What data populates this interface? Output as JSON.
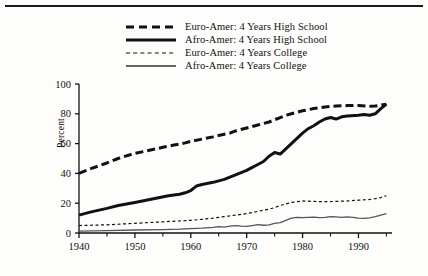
{
  "figure": {
    "name": "educational-attainment-line-chart",
    "background_color": "#fdfdfc",
    "ink_color": "#111111"
  },
  "chart_data": {
    "type": "line",
    "title": "",
    "subtitle": "",
    "xlabel": "",
    "ylabel": "Percent",
    "xlim": [
      1940,
      1996
    ],
    "ylim": [
      0,
      100
    ],
    "grid": false,
    "legend_position": "top-center",
    "x_ticks_major": [
      1940,
      1950,
      1960,
      1970,
      1980,
      1990
    ],
    "x_ticks_minor": [
      1945,
      1955,
      1965,
      1975,
      1985,
      1995
    ],
    "x_tick_labels": [
      "1940",
      "1950",
      "1960",
      "1970",
      "1980",
      "1990"
    ],
    "y_ticks": [
      0,
      20,
      40,
      60,
      80,
      100
    ],
    "y_tick_labels": [
      "0",
      "20",
      "40",
      "60",
      "80",
      "100"
    ],
    "series": [
      {
        "name": "Euro-Amer: 4 Years High School",
        "style": "thick-dashed",
        "color": "#111111",
        "width": 3.0,
        "dash": "8,4",
        "x": [
          1940,
          1942,
          1945,
          1947,
          1950,
          1952,
          1955,
          1957,
          1959,
          1960,
          1962,
          1964,
          1965,
          1967,
          1968,
          1970,
          1972,
          1974,
          1975,
          1976,
          1977,
          1978,
          1980,
          1982,
          1984,
          1985,
          1986,
          1988,
          1990,
          1992,
          1993,
          1994,
          1995
        ],
        "y": [
          40.0,
          43.0,
          47.0,
          50.0,
          53.5,
          55.0,
          57.5,
          59.0,
          60.5,
          61.5,
          63.0,
          64.5,
          65.5,
          67.0,
          68.5,
          70.5,
          72.5,
          74.5,
          76.0,
          77.5,
          79.0,
          80.0,
          82.0,
          83.5,
          84.5,
          85.0,
          85.2,
          85.5,
          85.5,
          85.0,
          85.2,
          85.8,
          86.5
        ],
        "endpoint_value": 86.5
      },
      {
        "name": "Afro-Amer: 4 Years High School",
        "style": "thick-solid",
        "color": "#111111",
        "width": 3.0,
        "dash": "",
        "x": [
          1940,
          1942,
          1945,
          1947,
          1950,
          1952,
          1954,
          1956,
          1958,
          1959,
          1960,
          1961,
          1962,
          1964,
          1966,
          1967,
          1968,
          1969,
          1970,
          1971,
          1972,
          1973,
          1974,
          1975,
          1976,
          1977,
          1978,
          1979,
          1980,
          1981,
          1982,
          1983,
          1984,
          1985,
          1986,
          1987,
          1988,
          1990,
          1991,
          1992,
          1993,
          1994,
          1995
        ],
        "y": [
          12.0,
          14.0,
          16.5,
          18.5,
          20.5,
          22.0,
          23.5,
          25.0,
          26.0,
          27.0,
          28.5,
          31.5,
          32.5,
          34.0,
          36.0,
          37.5,
          39.0,
          40.5,
          42.0,
          44.0,
          46.0,
          48.0,
          51.5,
          54.0,
          53.0,
          56.5,
          60.0,
          63.5,
          67.0,
          70.0,
          72.0,
          74.5,
          76.5,
          77.5,
          76.5,
          78.0,
          78.5,
          79.0,
          79.5,
          79.0,
          80.0,
          83.5,
          86.5
        ],
        "endpoint_value": 86.5
      },
      {
        "name": "Euro-Amer: 4 Years College",
        "style": "thin-dotted",
        "color": "#111111",
        "width": 1.2,
        "dash": "3,2.5",
        "x": [
          1940,
          1945,
          1950,
          1955,
          1960,
          1962,
          1964,
          1966,
          1968,
          1970,
          1972,
          1974,
          1975,
          1976,
          1977,
          1978,
          1979,
          1980,
          1982,
          1984,
          1986,
          1988,
          1990,
          1992,
          1993,
          1994,
          1995
        ],
        "y": [
          5.0,
          5.5,
          6.5,
          7.5,
          8.5,
          9.2,
          10.0,
          11.0,
          12.0,
          13.0,
          14.5,
          16.0,
          17.0,
          18.5,
          19.5,
          20.5,
          21.0,
          21.5,
          21.2,
          21.0,
          21.2,
          21.5,
          22.0,
          22.5,
          23.0,
          23.8,
          25.0
        ],
        "endpoint_value": 25.0
      },
      {
        "name": "Afro-Amer: 4 Years College",
        "style": "thin-solid",
        "color": "#555555",
        "width": 1.3,
        "dash": "",
        "x": [
          1940,
          1945,
          1950,
          1955,
          1958,
          1960,
          1962,
          1964,
          1965,
          1966,
          1967,
          1968,
          1969,
          1970,
          1971,
          1972,
          1973,
          1974,
          1975,
          1976,
          1977,
          1978,
          1979,
          1980,
          1981,
          1982,
          1983,
          1984,
          1985,
          1986,
          1987,
          1988,
          1989,
          1990,
          1991,
          1992,
          1993,
          1994,
          1995
        ],
        "y": [
          1.3,
          1.6,
          2.0,
          2.3,
          2.6,
          3.0,
          3.3,
          3.8,
          4.3,
          4.0,
          4.6,
          5.0,
          4.6,
          4.4,
          5.0,
          5.6,
          5.2,
          5.5,
          6.5,
          7.0,
          8.5,
          10.0,
          10.5,
          10.3,
          10.5,
          10.6,
          10.3,
          10.5,
          11.0,
          10.8,
          10.5,
          10.8,
          10.5,
          10.0,
          9.8,
          10.2,
          11.0,
          12.0,
          13.0
        ],
        "endpoint_value": 13.0
      }
    ]
  },
  "legend": {
    "items": [
      {
        "label": "Euro-Amer: 4 Years High School",
        "sample": "thick-dashed"
      },
      {
        "label": "Afro-Amer: 4 Years High School",
        "sample": "thick-solid"
      },
      {
        "label": "Euro-Amer: 4 Years College",
        "sample": "thin-dotted"
      },
      {
        "label": "Afro-Amer: 4 Years College",
        "sample": "thin-solid"
      }
    ]
  },
  "axis": {
    "y_title": "Percent"
  }
}
